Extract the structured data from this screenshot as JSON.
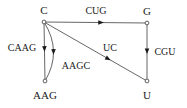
{
  "diagram": {
    "type": "directed-graph",
    "title": "",
    "width": 187,
    "height": 108,
    "colors": {
      "background": "#ffffff",
      "edge": "#555555",
      "node_stroke": "#4d4d4d",
      "node_fill": "#ffffff",
      "text": "#1a1a1a",
      "arrow": "#1a1a1a"
    },
    "nodes": [
      {
        "id": "C",
        "label": "C",
        "x": 44,
        "y": 22,
        "label_x": 44,
        "label_y": 10
      },
      {
        "id": "G",
        "label": "G",
        "x": 147,
        "y": 23,
        "label_x": 147,
        "label_y": 11
      },
      {
        "id": "AAG",
        "label": "AAG",
        "x": 45,
        "y": 81,
        "label_x": 45,
        "label_y": 95
      },
      {
        "id": "U",
        "label": "U",
        "x": 147,
        "y": 81,
        "label_x": 147,
        "label_y": 95
      }
    ],
    "edges": [
      {
        "id": "c-to-g",
        "from": "C",
        "to": "G",
        "label": "CUG",
        "shape": "straight",
        "label_x": 96,
        "label_y": 11,
        "arrow_t": 0.55
      },
      {
        "id": "c-to-aag-straight",
        "from": "C",
        "to": "AAG",
        "label": "CAAG",
        "shape": "straight",
        "label_x": 22,
        "label_y": 48,
        "arrow_t": 0.45
      },
      {
        "id": "c-to-aag-curved",
        "from": "C",
        "to": "AAG",
        "label": "AAGC",
        "shape": "curved",
        "curve_dx": 18,
        "label_x": 76,
        "label_y": 66,
        "arrow_t": 0.5
      },
      {
        "id": "c-to-u",
        "from": "C",
        "to": "U",
        "label": "UC",
        "shape": "straight",
        "label_x": 110,
        "label_y": 48,
        "arrow_t": 0.62
      },
      {
        "id": "g-to-u",
        "from": "G",
        "to": "U",
        "label": "CGU",
        "shape": "straight",
        "label_x": 165,
        "label_y": 52,
        "arrow_t": 0.48
      }
    ]
  }
}
